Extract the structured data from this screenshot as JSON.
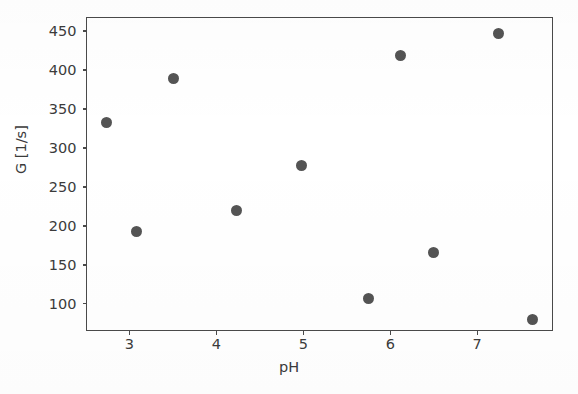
{
  "chart_data": {
    "type": "scatter",
    "title": "",
    "xlabel": "pH",
    "ylabel": "G [1/s]",
    "xlim": [
      2.52,
      7.89
    ],
    "ylim": [
      63,
      466
    ],
    "xticks": [
      3,
      4,
      5,
      6,
      7
    ],
    "xtick_labels": [
      "3",
      "4",
      "5",
      "6",
      "7"
    ],
    "yticks": [
      100,
      150,
      200,
      250,
      300,
      350,
      400,
      450
    ],
    "ytick_labels": [
      "100",
      "150",
      "200",
      "250",
      "300",
      "350",
      "400",
      "450"
    ],
    "grid": false,
    "legend": null,
    "marker_color": "#545454",
    "marker": "circle",
    "x": [
      2.74,
      3.09,
      3.51,
      4.24,
      4.99,
      5.76,
      6.12,
      6.51,
      7.25,
      7.64
    ],
    "y": [
      332,
      192,
      388,
      219,
      277,
      106,
      418,
      165,
      446,
      79
    ],
    "points": [
      {
        "x": 2.74,
        "y": 332
      },
      {
        "x": 3.09,
        "y": 192
      },
      {
        "x": 3.51,
        "y": 388
      },
      {
        "x": 4.24,
        "y": 219
      },
      {
        "x": 4.99,
        "y": 277
      },
      {
        "x": 5.76,
        "y": 106
      },
      {
        "x": 6.12,
        "y": 418
      },
      {
        "x": 6.51,
        "y": 165
      },
      {
        "x": 7.25,
        "y": 446
      },
      {
        "x": 7.64,
        "y": 79
      }
    ]
  }
}
